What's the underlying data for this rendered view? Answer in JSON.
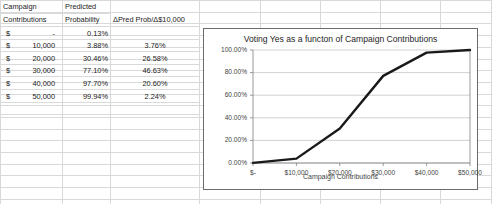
{
  "table": {
    "headers": {
      "col_a_line1": "Campaign",
      "col_a_line2": "Contributions",
      "col_b_line1": "Predicted",
      "col_b_line2": "Probability",
      "col_c": "ΔPred Prob/Δ$10,000"
    },
    "currency_symbol": "$",
    "rows": [
      {
        "contribution": "-",
        "probability": "0.13%",
        "delta": ""
      },
      {
        "contribution": "10,000",
        "probability": "3.88%",
        "delta": "3.76%"
      },
      {
        "contribution": "20,000",
        "probability": "30.46%",
        "delta": "26.58%"
      },
      {
        "contribution": "30,000",
        "probability": "77.10%",
        "delta": "46.63%"
      },
      {
        "contribution": "40,000",
        "probability": "97.70%",
        "delta": "20.60%"
      },
      {
        "contribution": "50,000",
        "probability": "99.94%",
        "delta": "2.24%"
      }
    ]
  },
  "chart_data": {
    "type": "line",
    "title": "Voting Yes as a functon of Campaign Contributions",
    "xlabel": "Campaign Contributions",
    "ylabel": "",
    "x": [
      0,
      10000,
      20000,
      30000,
      40000,
      50000
    ],
    "categories": [
      "$-",
      "$10,000",
      "$20,000",
      "$30,000",
      "$40,000",
      "$50,000"
    ],
    "values": [
      0.13,
      3.88,
      30.46,
      77.1,
      97.7,
      99.94
    ],
    "series": [
      {
        "name": "Predicted Probability",
        "values": [
          0.13,
          3.88,
          30.46,
          77.1,
          97.7,
          99.94
        ]
      }
    ],
    "ylim": [
      0,
      100
    ],
    "xlim": [
      0,
      50000
    ],
    "yticks": [
      "0.00%",
      "20.00%",
      "40.00%",
      "60.00%",
      "80.00%",
      "100.00%"
    ],
    "ytick_values": [
      0,
      20,
      40,
      60,
      80,
      100
    ],
    "xticks": [
      "$-",
      "$10,000",
      "$20,000",
      "$30,000",
      "$40,000",
      "$50,000"
    ],
    "grid": "horizontal",
    "legend": "none",
    "line_color": "#1a1a1a",
    "plot_background": "#ffffff"
  }
}
